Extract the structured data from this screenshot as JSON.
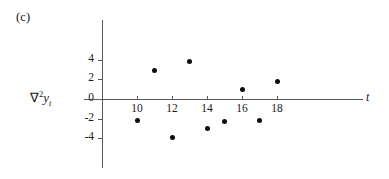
{
  "figure": {
    "panel_label": "(c)",
    "ylabel_parts": {
      "nabla": "∇",
      "exponent": "2",
      "variable": "y",
      "subscript": "t"
    },
    "xlabel": "t"
  },
  "chart_data": {
    "type": "scatter",
    "title": "(c)",
    "xlabel": "t",
    "ylabel": "∇2yt",
    "x": [
      10,
      11,
      12,
      13,
      14,
      15,
      16,
      17,
      18
    ],
    "values": [
      -2.2,
      2.9,
      -3.9,
      3.85,
      -3.05,
      -2.3,
      1.0,
      -2.2,
      1.8
    ],
    "series": [
      {
        "name": "∇2yt",
        "x": [
          10,
          11,
          12,
          13,
          14,
          15,
          16,
          17,
          18
        ],
        "values": [
          -2.2,
          2.9,
          -3.9,
          3.85,
          -3.05,
          -2.3,
          1.0,
          -2.2,
          1.8
        ]
      }
    ],
    "xticks": [
      10,
      12,
      14,
      16,
      18
    ],
    "xticklabels": [
      "10",
      "12",
      "14",
      "16",
      "18"
    ],
    "yticks": [
      4,
      2,
      0,
      -2,
      -4
    ],
    "yticklabels": [
      "4",
      "2",
      "0",
      "-2",
      "-4"
    ],
    "xlim": [
      8.95,
      19.8
    ],
    "ylim": [
      -5.9,
      4.9
    ],
    "grid": false,
    "legend": false,
    "marker": "filled-circle",
    "marker_color": "#0d0d0d",
    "axis_color": "#5a5a5a"
  },
  "geometry": {
    "x_axis_y": 99,
    "y_axis_x": 102,
    "x_unit_px": 17.5,
    "y_unit_px": 9.8,
    "x_origin_value": 10,
    "x_origin_px": 137
  }
}
